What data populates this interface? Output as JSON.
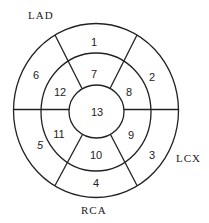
{
  "diagram": {
    "type": "bullseye-polar-map",
    "center": {
      "x": 96,
      "y": 111
    },
    "rings": [
      {
        "name": "inner",
        "rx": 27,
        "ry": 27
      },
      {
        "name": "middle",
        "rx": 55,
        "ry": 58
      },
      {
        "name": "outer",
        "rx": 83,
        "ry": 87
      }
    ],
    "segments": [
      {
        "id": "1",
        "label": "1",
        "ring": "outer",
        "x": 94,
        "y": 42
      },
      {
        "id": "2",
        "label": "2",
        "ring": "outer",
        "x": 152,
        "y": 77
      },
      {
        "id": "3",
        "label": "3",
        "ring": "outer",
        "x": 152,
        "y": 155
      },
      {
        "id": "4",
        "label": "4",
        "ring": "outer",
        "x": 96,
        "y": 183
      },
      {
        "id": "5",
        "label": "5",
        "ring": "outer",
        "x": 40,
        "y": 145
      },
      {
        "id": "6",
        "label": "6",
        "ring": "outer",
        "x": 36,
        "y": 75
      },
      {
        "id": "7",
        "label": "7",
        "ring": "middle",
        "x": 94,
        "y": 74
      },
      {
        "id": "8",
        "label": "8",
        "ring": "middle",
        "x": 129,
        "y": 92
      },
      {
        "id": "9",
        "label": "9",
        "ring": "middle",
        "x": 131,
        "y": 135
      },
      {
        "id": "10",
        "label": "10",
        "ring": "middle",
        "x": 96,
        "y": 155
      },
      {
        "id": "11",
        "label": "11",
        "ring": "middle",
        "x": 59,
        "y": 134
      },
      {
        "id": "12",
        "label": "12",
        "ring": "middle",
        "x": 60,
        "y": 92
      },
      {
        "id": "13",
        "label": "13",
        "ring": "center",
        "x": 97,
        "y": 112
      }
    ],
    "arteries": [
      {
        "id": "lad",
        "label": "LAD",
        "x": 28,
        "y": 15
      },
      {
        "id": "lcx",
        "label": "LCX",
        "x": 176,
        "y": 158
      },
      {
        "id": "rca",
        "label": "RCA",
        "x": 81,
        "y": 210
      }
    ]
  }
}
